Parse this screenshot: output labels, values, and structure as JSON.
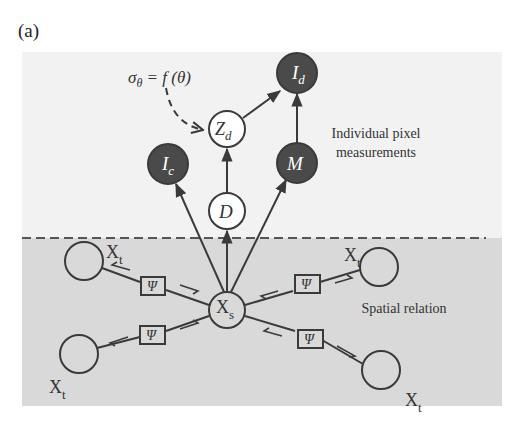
{
  "figure": {
    "panel_label": "(a)",
    "upper_region_label_line1": "Individual pixel",
    "upper_region_label_line2": "measurements",
    "lower_region_label": "Spatial relation",
    "annotation": "σθ = f(θ)",
    "colors": {
      "upper_bg": "#f2f2f2",
      "lower_bg": "#d9d9d9",
      "observed_node": "#4a4a4a",
      "hidden_node": "#ffffff",
      "stroke": "#3a3a3a"
    }
  },
  "nodes": {
    "Id": {
      "label": "I",
      "sub": "d",
      "observed": true
    },
    "Zd": {
      "label": "Z",
      "sub": "d",
      "observed": false
    },
    "Ic": {
      "label": "I",
      "sub": "c",
      "observed": true
    },
    "M": {
      "label": "M",
      "sub": "",
      "observed": true
    },
    "D": {
      "label": "D",
      "sub": "",
      "observed": false
    },
    "Xs": {
      "label": "X",
      "sub": "s",
      "observed": false
    },
    "Xt": {
      "label": "X",
      "sub": "t"
    }
  },
  "factors": {
    "psi": "Ψ"
  }
}
